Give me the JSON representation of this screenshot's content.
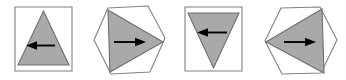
{
  "figure": {
    "background_color": "#ffffff",
    "panel_count": 4,
    "colors": {
      "triangle_fill": "#a9a9a9",
      "triangle_stroke": "#6e6e6e",
      "frame_stroke": "#808080",
      "arrow_color": "#000000",
      "background": "#ffffff"
    }
  },
  "panels": [
    {
      "index": 1,
      "name": "panel-1",
      "frame_shape": "square",
      "triangle_direction": "up",
      "arrow_direction": "left",
      "arrow_glyph": "←",
      "label": "Panel 1"
    },
    {
      "index": 2,
      "name": "panel-2",
      "frame_shape": "hexagon",
      "triangle_direction": "right",
      "arrow_direction": "right",
      "arrow_glyph": "→",
      "label": "Panel 2"
    },
    {
      "index": 3,
      "name": "panel-3",
      "frame_shape": "square",
      "triangle_direction": "down",
      "arrow_direction": "left",
      "arrow_glyph": "←",
      "label": "Panel 3"
    },
    {
      "index": 4,
      "name": "panel-4",
      "frame_shape": "hexagon",
      "triangle_direction": "left",
      "arrow_direction": "right",
      "arrow_glyph": "→",
      "label": "Panel 4"
    }
  ]
}
